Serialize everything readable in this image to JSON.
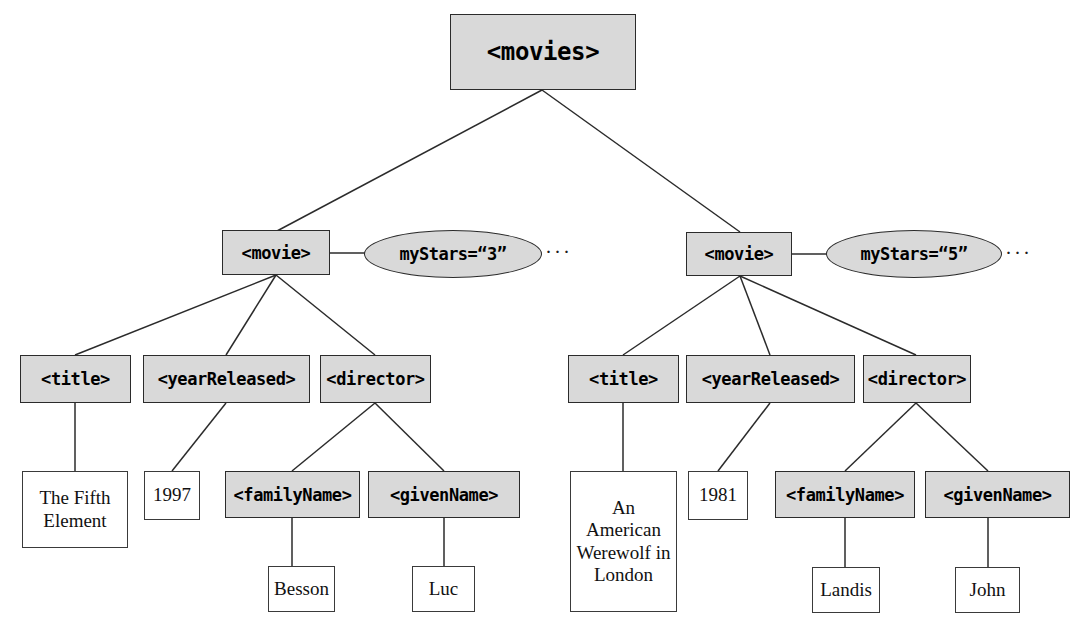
{
  "diagram": {
    "title_text": "XML document tree for movies",
    "colors": {
      "element_fill": "#d9d9d9",
      "text_fill": "#ffffff",
      "stroke": "#2b2b2b",
      "background": "#ffffff"
    },
    "root": {
      "label": "<movies>"
    },
    "movies": [
      {
        "element_label": "<movie>",
        "attribute_label": "myStars=“3”",
        "attribute_ellipsis": "···",
        "children": [
          {
            "element_label": "<title>",
            "value": "The Fifth Element"
          },
          {
            "element_label": "<yearReleased>",
            "value": "1997"
          },
          {
            "element_label": "<director>",
            "children": [
              {
                "element_label": "<familyName>",
                "value": "Besson"
              },
              {
                "element_label": "<givenName>",
                "value": "Luc"
              }
            ]
          }
        ]
      },
      {
        "element_label": "<movie>",
        "attribute_label": "myStars=“5”",
        "attribute_ellipsis": "···",
        "children": [
          {
            "element_label": "<title>",
            "value": "An American Werewolf in London"
          },
          {
            "element_label": "<yearReleased>",
            "value": "1981"
          },
          {
            "element_label": "<director>",
            "children": [
              {
                "element_label": "<familyName>",
                "value": "Landis"
              },
              {
                "element_label": "<givenName>",
                "value": "John"
              }
            ]
          }
        ]
      }
    ]
  }
}
